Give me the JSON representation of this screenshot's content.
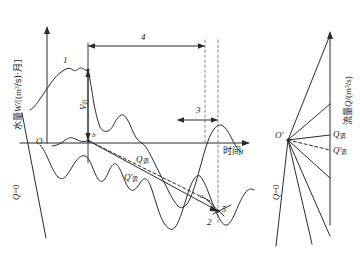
{
  "figure": {
    "type": "hydrology-regulation-diagram",
    "stroke_color": "#2b2b2b",
    "dash_color": "#6f6f6f"
  },
  "left_panel": {
    "y_axis": {
      "label_cn": "水量",
      "label_var": "W",
      "label_unit_pre": "/[(m",
      "label_unit_exp": "3",
      "label_unit_post": "/s)·月]",
      "origin_label": "O"
    },
    "x_axis": {
      "label_cn": "时间",
      "label_var": "t"
    },
    "zero_line_label": {
      "var": "Q",
      "eq": "=0"
    },
    "annotations": [
      {
        "name": "curve-1-label",
        "text": "1"
      },
      {
        "name": "curve-2-label",
        "text": "2"
      },
      {
        "name": "span-4-label",
        "text": "4"
      },
      {
        "name": "span-3-label",
        "text": "3"
      },
      {
        "name": "point-5-label",
        "text": "5"
      },
      {
        "name": "point-a-label",
        "text": "a"
      },
      {
        "name": "point-b-label",
        "text": "b"
      }
    ],
    "v_label": {
      "var": "V",
      "sub": "兴"
    },
    "q_label": {
      "var": "Q",
      "sub": "调"
    },
    "q_prime_label": {
      "var": "Q",
      "prime": "′",
      "sub": "调"
    }
  },
  "right_panel": {
    "y_axis": {
      "label_cn": "流量",
      "label_var": "Q",
      "label_unit_pre": "/(m",
      "label_unit_exp": "3",
      "label_unit_post": "/s)"
    },
    "origin_label": "O′",
    "zero_line_label": {
      "var": "Q",
      "eq": "=0"
    },
    "q_label": {
      "var": "Q",
      "sub": "调"
    },
    "q_prime_label": {
      "var": "Q",
      "prime": "′",
      "sub": "调"
    }
  }
}
